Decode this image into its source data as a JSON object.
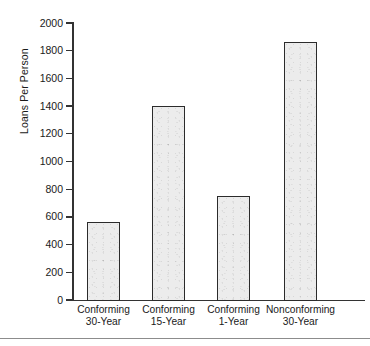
{
  "chart_data": {
    "type": "bar",
    "title": "",
    "xlabel": "",
    "ylabel": "Loans Per Person",
    "categories": [
      "Conforming 30-Year",
      "Conforming 15-Year",
      "Conforming 1-Year",
      "Nonconforming 30-Year"
    ],
    "category_lines": [
      [
        "Conforming",
        "30-Year"
      ],
      [
        "Conforming",
        "15-Year"
      ],
      [
        "Conforming",
        "1-Year"
      ],
      [
        "Nonconforming",
        "30-Year"
      ]
    ],
    "values": [
      565,
      1400,
      750,
      1860
    ],
    "ylim": [
      0,
      2000
    ],
    "ytick_values": [
      0,
      200,
      400,
      600,
      800,
      1000,
      1200,
      1400,
      1600,
      1800,
      2000
    ],
    "ytick_labels": [
      "0",
      "200",
      "400",
      "600",
      "800",
      "1000",
      "1200",
      "1400",
      "1600",
      "1800",
      "2000"
    ],
    "grid": false,
    "legend": null,
    "bar_fill_color": "#ececec",
    "bar_edge_color": "#2b2b2b",
    "axis_color": "#333333"
  }
}
